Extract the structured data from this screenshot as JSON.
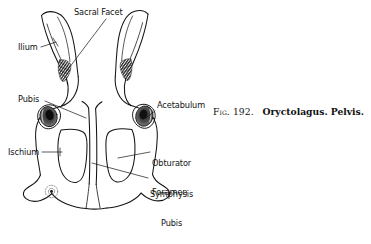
{
  "figure": {
    "caption": {
      "fig_label": "Fig. 192.",
      "title": "Oryctolagus. Pelvis."
    },
    "ink_color": "#141414",
    "background_color": "#ffffff",
    "labels": [
      {
        "id": "sacral-facet",
        "text": "Sacral Facet",
        "x": 74,
        "y": 8,
        "align": "left"
      },
      {
        "id": "ilium",
        "text": "Ilium",
        "x": 18,
        "y": 43,
        "align": "left"
      },
      {
        "id": "pubis",
        "text": "Pubis",
        "x": 18,
        "y": 95,
        "align": "left"
      },
      {
        "id": "acetabulum",
        "text": "Acetabulum",
        "x": 157,
        "y": 101,
        "align": "left"
      },
      {
        "id": "ischium",
        "text": "Ischium",
        "x": 8,
        "y": 148,
        "align": "left"
      },
      {
        "id": "obturator-foramen",
        "text": "Obturator",
        "text2": "Foramen",
        "x": 152,
        "y": 140,
        "align": "left"
      },
      {
        "id": "symphysis-pubis",
        "text": "Symphysis",
        "text2": "Pubis",
        "x": 150,
        "y": 171,
        "align": "left"
      }
    ]
  }
}
